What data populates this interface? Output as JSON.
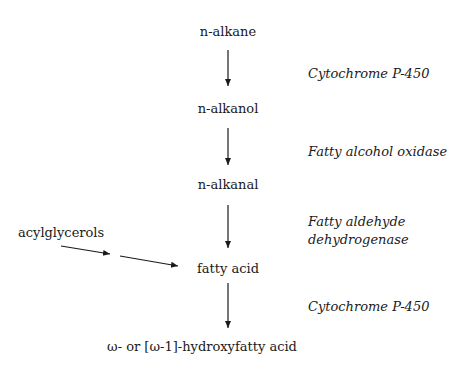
{
  "pathway": {
    "nodes": [
      {
        "id": "n-alkane",
        "label": "n-alkane"
      },
      {
        "id": "n-alkanol",
        "label": "n-alkanol"
      },
      {
        "id": "n-alkanal",
        "label": "n-alkanal"
      },
      {
        "id": "fatty-acid",
        "label": "fatty acid"
      },
      {
        "id": "hydroxyfatty-acid",
        "label": "ω- or [ω-1]-hydroxyfatty acid"
      }
    ],
    "enzymes": [
      {
        "step": "n-alkane → n-alkanol",
        "label": "Cytochrome P-450"
      },
      {
        "step": "n-alkanol → n-alkanal",
        "label": "Fatty alcohol oxidase"
      },
      {
        "step": "n-alkanal → fatty acid",
        "label_line1": "Fatty aldehyde",
        "label_line2": "dehydrogenase"
      },
      {
        "step": "fatty acid → hydroxyfatty acid",
        "label": "Cytochrome P-450"
      }
    ],
    "side_input": {
      "label": "acylglycerols",
      "target": "fatty acid"
    }
  }
}
